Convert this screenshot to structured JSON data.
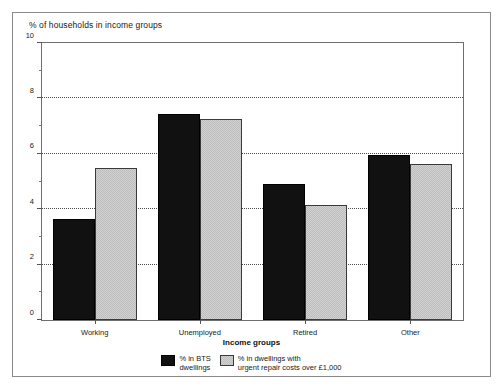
{
  "figure": {
    "title": "% of households in income groups",
    "xaxis_title": "Income groups"
  },
  "legend": [
    {
      "key": "bts",
      "label": "% in BTS\ndwellings",
      "color": "#111111"
    },
    {
      "key": "repair",
      "label": "% in dwellings with\nurgent repair costs over £1,000",
      "color": "#d2d2d2"
    }
  ],
  "chart_data": {
    "type": "bar",
    "title": "% of households in income groups",
    "xlabel": "Income groups",
    "ylabel": "",
    "ylim": [
      0,
      10
    ],
    "yticks": [
      0,
      2,
      4,
      6,
      8,
      10
    ],
    "yticks_minor": [
      1,
      3,
      5,
      7,
      9
    ],
    "grid": "horizontal-dotted-at-major",
    "legend_position": "bottom-center",
    "categories": [
      "Working",
      "Unemployed",
      "Retired",
      "Other"
    ],
    "series": [
      {
        "name": "% in BTS dwellings",
        "color": "#111111",
        "values": [
          3.65,
          7.45,
          4.9,
          5.95
        ]
      },
      {
        "name": "% in dwellings with urgent repair costs over £1,000",
        "color": "#d2d2d2",
        "values": [
          5.48,
          7.24,
          4.15,
          5.65
        ]
      }
    ]
  }
}
